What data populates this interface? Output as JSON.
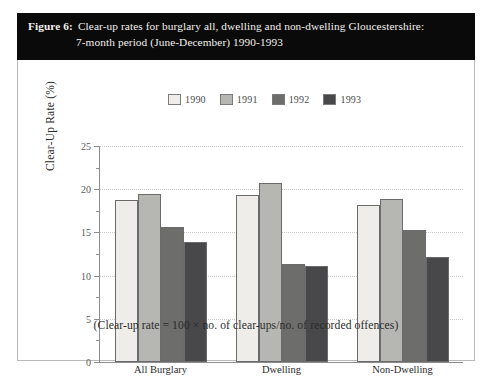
{
  "figure": {
    "label": "Figure 6:",
    "title_line1": "Clear-up rates for burglary all, dwelling and non-dwelling Gloucestershire:",
    "title_line2": "7-month period (June-December) 1990-1993",
    "footnote": "(Clear-up rate = 100 × no. of clear-ups/no. of recorded offences)"
  },
  "colors": {
    "caption_bar": "#0a0a0a",
    "caption_text": "#f2f0ec",
    "axis": "#8c8c8c",
    "grid": "#c9c9c9",
    "bar_border": "#6b6b6b",
    "series_1990": "#eeedea",
    "series_1991": "#b6b6b3",
    "series_1992": "#6d6d6b",
    "series_1993": "#48484a"
  },
  "chart_data": {
    "type": "bar",
    "title": "Clear-up rates for burglary all, dwelling and non-dwelling Gloucestershire: 7-month period (June-December) 1990-1993",
    "xlabel": "",
    "ylabel": "Clear-Up Rate (%)",
    "ylim": [
      0,
      25
    ],
    "ytick_labels": [
      "0",
      "5",
      "10",
      "15",
      "20",
      "25"
    ],
    "ytick_values": [
      0,
      5,
      10,
      15,
      20,
      25
    ],
    "yminor_values": [
      2.5,
      7.5,
      12.5,
      17.5,
      22.5
    ],
    "grid": true,
    "legend_position": "top-center",
    "categories": [
      "All Burglary",
      "Dwelling",
      "Non-Dwelling"
    ],
    "series": [
      {
        "name": "1990",
        "color": "#eeedea",
        "values": [
          18.7,
          19.3,
          18.2
        ]
      },
      {
        "name": "1991",
        "color": "#b6b6b3",
        "values": [
          19.5,
          20.7,
          18.9
        ]
      },
      {
        "name": "1992",
        "color": "#6d6d6b",
        "values": [
          15.6,
          11.4,
          15.3
        ]
      },
      {
        "name": "1993",
        "color": "#48484a",
        "values": [
          13.9,
          11.1,
          12.2
        ]
      }
    ],
    "annotations": [
      "(Clear-up rate = 100 × no. of clear-ups/no. of recorded offences)"
    ]
  }
}
